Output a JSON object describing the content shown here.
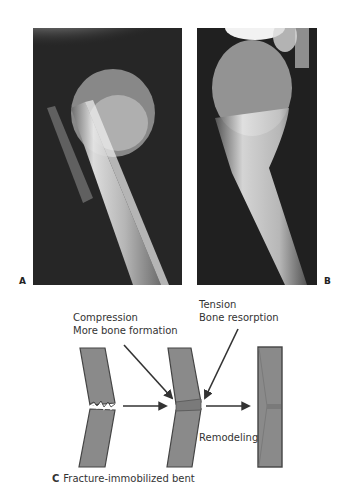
{
  "panels": {
    "a": {
      "label": "A",
      "description": "X-ray of fractured proximal humerus, bent"
    },
    "b": {
      "label": "B",
      "description": "X-ray of remodeled proximal humerus"
    }
  },
  "diagram": {
    "compression_label": "Compression",
    "compression_sub": "More bone formation",
    "tension_label": "Tension",
    "tension_sub": "Bone resorption",
    "remodeling_label": "Remodeling",
    "caption_letter": "C",
    "caption_text": "Fracture-immobilized bent"
  },
  "colors": {
    "bone_fill": "#8a8a8a",
    "bone_outline": "#444444",
    "arrow": "#333333",
    "xray_bg": "#1e1e1e"
  }
}
